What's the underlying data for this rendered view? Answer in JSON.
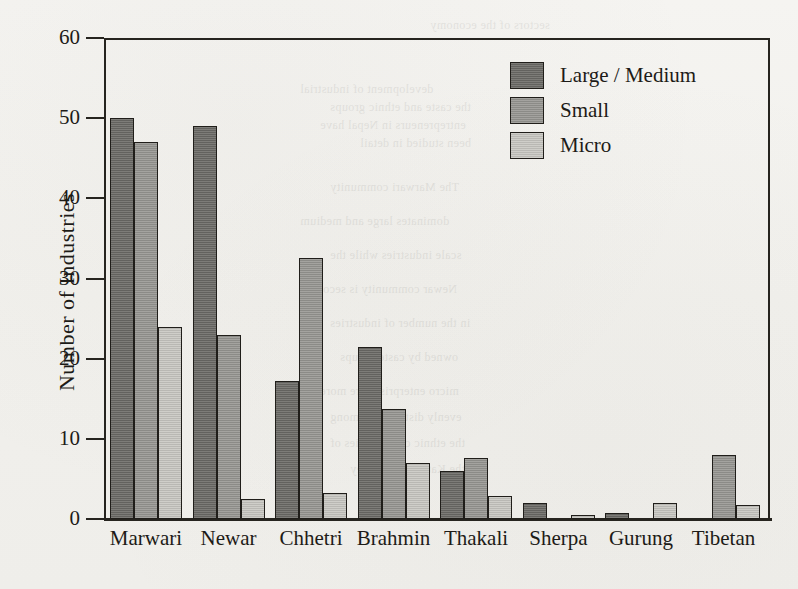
{
  "chart_data": {
    "type": "bar",
    "title": "",
    "subtitle": "",
    "xlabel": "",
    "ylabel": "Number of Industries",
    "ylim": [
      0,
      60
    ],
    "yticks": [
      0,
      10,
      20,
      30,
      40,
      50,
      60
    ],
    "ytick_labels": [
      "0",
      "10",
      "20",
      "30",
      "40",
      "50",
      "60"
    ],
    "grid": false,
    "legend_position": "top-right",
    "categories": [
      "Marwari",
      "Newar",
      "Chhetri",
      "Brahmin",
      "Thakali",
      "Sherpa",
      "Gurung",
      "Tibetan"
    ],
    "series": [
      {
        "name": "Large / Medium",
        "color": "#6b6a66",
        "values": [
          50,
          49,
          17.2,
          21.5,
          6,
          2,
          0.8,
          0
        ]
      },
      {
        "name": "Small",
        "color": "#979692",
        "values": [
          47,
          23,
          32.5,
          13.7,
          7.6,
          0,
          0,
          8
        ]
      },
      {
        "name": "Micro",
        "color": "#c8c7c2",
        "values": [
          24,
          2.5,
          3.3,
          7,
          2.9,
          0.5,
          2,
          1.8
        ]
      }
    ]
  },
  "legend": {
    "entries": [
      {
        "label": "Large / Medium",
        "swatch": "dark-gray-swatch"
      },
      {
        "label": "Small",
        "swatch": "medium-gray-swatch"
      },
      {
        "label": "Micro",
        "swatch": "light-gray-swatch"
      }
    ]
  },
  "axes": {
    "y_title": "Number of Industries"
  },
  "colors": {
    "background": "#f3f2ef",
    "axis": "#26241f",
    "text": "#1d1b17",
    "series_large_medium": "#6b6a66",
    "series_small": "#979692",
    "series_micro": "#c8c7c2"
  },
  "ghost_text": [
    {
      "text": "sectors of the economy",
      "x": 430,
      "y": 18
    },
    {
      "text": "development of industrial",
      "x": 300,
      "y": 82
    },
    {
      "text": "the caste and ethnic groups",
      "x": 330,
      "y": 100
    },
    {
      "text": "entrepreneurs in Nepal have",
      "x": 320,
      "y": 118
    },
    {
      "text": "been studied in detail",
      "x": 360,
      "y": 136
    },
    {
      "text": "The Marwari community",
      "x": 330,
      "y": 180
    },
    {
      "text": "dominates large and medium",
      "x": 300,
      "y": 214
    },
    {
      "text": "scale industries while the",
      "x": 330,
      "y": 248
    },
    {
      "text": "Newar community is second",
      "x": 310,
      "y": 282
    },
    {
      "text": "in the number of industries",
      "x": 330,
      "y": 316
    },
    {
      "text": "owned by caste groups",
      "x": 340,
      "y": 350
    },
    {
      "text": "micro enterprises are more",
      "x": 320,
      "y": 384
    },
    {
      "text": "evenly distributed among",
      "x": 330,
      "y": 410
    },
    {
      "text": "the ethnic communities of",
      "x": 330,
      "y": 436
    },
    {
      "text": "the Kathmandu Valley",
      "x": 350,
      "y": 462
    }
  ]
}
